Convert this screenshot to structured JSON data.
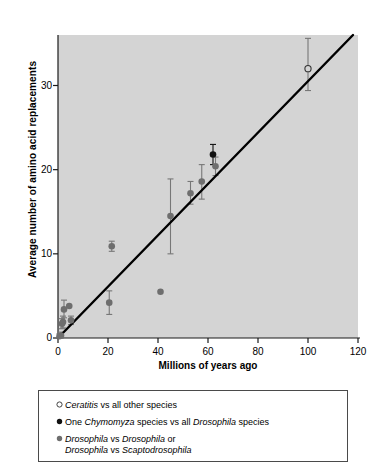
{
  "chart_data": {
    "type": "scatter",
    "title": "",
    "xlabel": "Millions of years ago",
    "ylabel": "Average number of amino acid replacements",
    "xlim": [
      0,
      120
    ],
    "ylim": [
      0,
      36
    ],
    "xticks": [
      0,
      20,
      40,
      60,
      80,
      100,
      120
    ],
    "yticks": [
      0,
      10,
      20,
      30
    ],
    "grid": false,
    "legend_position": "below-plot",
    "panel_color": "#d4d4d4",
    "trendline": {
      "label": "regression line",
      "x": [
        0,
        118
      ],
      "y": [
        0,
        36
      ],
      "color": "#000000"
    },
    "series": [
      {
        "name": "Ceratitis vs all other species",
        "marker": "open-circle",
        "color": "#555555",
        "points": [
          {
            "x": 100,
            "y": 32,
            "err_low": 29.4,
            "err_high": 35.6
          }
        ]
      },
      {
        "name": "One Chymomyza species vs all Drosophila species",
        "marker": "filled-circle",
        "color": "#111111",
        "points": [
          {
            "x": 62,
            "y": 21.8,
            "err_low": 20.6,
            "err_high": 23.0
          }
        ]
      },
      {
        "name": "Drosophila vs Drosophila or Drosophila vs Scaptodrosophila",
        "marker": "filled-circle-gray",
        "color": "#6e6e6e",
        "points": [
          {
            "x": 0.6,
            "y": 0.2,
            "err_low": 0.0,
            "err_high": 0.5
          },
          {
            "x": 1.2,
            "y": 0.3,
            "err_low": 0.0,
            "err_high": 0.7
          },
          {
            "x": 1.6,
            "y": 1.7,
            "err_low": 1.1,
            "err_high": 2.3
          },
          {
            "x": 2.0,
            "y": 1.9,
            "err_low": 1.2,
            "err_high": 2.6
          },
          {
            "x": 2.4,
            "y": 3.4,
            "err_low": 2.4,
            "err_high": 4.5
          },
          {
            "x": 4.5,
            "y": 3.8,
            "err_low": 3.8,
            "err_high": 3.8
          },
          {
            "x": 5.2,
            "y": 2.1,
            "err_low": 1.6,
            "err_high": 2.6
          },
          {
            "x": 20.5,
            "y": 4.2,
            "err_low": 2.8,
            "err_high": 5.6
          },
          {
            "x": 21.5,
            "y": 10.9,
            "err_low": 10.3,
            "err_high": 11.5
          },
          {
            "x": 41.0,
            "y": 5.5,
            "err_low": 5.5,
            "err_high": 5.5
          },
          {
            "x": 45.0,
            "y": 14.5,
            "err_low": 10.0,
            "err_high": 18.9
          },
          {
            "x": 53.0,
            "y": 17.2,
            "err_low": 15.9,
            "err_high": 18.6
          },
          {
            "x": 57.5,
            "y": 18.6,
            "err_low": 16.5,
            "err_high": 20.6
          },
          {
            "x": 63.0,
            "y": 20.4,
            "err_low": 19.3,
            "err_high": 21.5
          }
        ]
      }
    ]
  },
  "axes": {
    "x_tick_labels": [
      "0",
      "20",
      "40",
      "60",
      "80",
      "100",
      "120"
    ],
    "y_tick_labels": [
      "0",
      "10",
      "20",
      "30"
    ],
    "x_title": "Millions of years ago",
    "y_title": "Average number of amino acid replacements"
  },
  "legend": {
    "items": [
      {
        "marker": "open-circle",
        "line1_pre": "",
        "line1_italic": "Ceratitis",
        "line1_post": " vs all other species",
        "line2": ""
      },
      {
        "marker": "filled-circle",
        "line1_pre": "One ",
        "line1_italic": "Chymomyza",
        "line1_post": " species vs all ",
        "line1_italic2": "Drosophila",
        "line1_post2": " species",
        "line2": ""
      },
      {
        "marker": "filled-circle-gray",
        "line1_italic": "Drosophila",
        "line1_mid": " vs ",
        "line1_italic2": "Drosophila",
        "line1_post2": " or",
        "line2_italic": "Drosophila",
        "line2_mid": " vs ",
        "line2_italic2": "Scaptodrosophila"
      }
    ]
  }
}
